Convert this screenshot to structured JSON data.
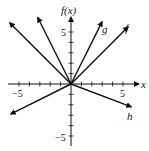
{
  "chart_data": {
    "type": "line",
    "title": "",
    "xlabel": "x",
    "ylabel": "f(x)",
    "xlim": [
      -6,
      6.5
    ],
    "ylim": [
      -6,
      6.5
    ],
    "grid": false,
    "tick_labels": {
      "x": [
        {
          "value": -5,
          "label": "−5"
        },
        {
          "value": 5,
          "label": "5"
        }
      ],
      "y": [
        {
          "value": 5,
          "label": "5"
        },
        {
          "value": -5,
          "label": "−5"
        }
      ]
    },
    "ticks": [
      -5,
      -4,
      -3,
      -2,
      -1,
      1,
      2,
      3,
      4,
      5
    ],
    "series": [
      {
        "name": "f",
        "label": "f",
        "formula": "|x|",
        "points": [
          [
            -5.9,
            5.9
          ],
          [
            0,
            0
          ],
          [
            5.5,
            5.5
          ]
        ]
      },
      {
        "name": "g",
        "label": "g",
        "formula": "2|x|",
        "points": [
          [
            -3.2,
            6.4
          ],
          [
            0,
            0
          ],
          [
            3.0,
            6.0
          ]
        ]
      },
      {
        "name": "h",
        "label": "h",
        "formula": "-1/2|x|",
        "points": [
          [
            -5.8,
            -2.9
          ],
          [
            0,
            0
          ],
          [
            5.8,
            -2.2
          ]
        ]
      }
    ],
    "legend": "inline labels near line ends"
  },
  "labels": {
    "x_axis": "x",
    "y_axis": "f(x)",
    "x_neg5": "−5",
    "x_pos5": "5",
    "y_pos5": "5",
    "y_neg5": "−5",
    "f": "f",
    "g": "g",
    "h": "h"
  },
  "colors": {
    "ink": "#111111",
    "background": "#ffffff"
  }
}
